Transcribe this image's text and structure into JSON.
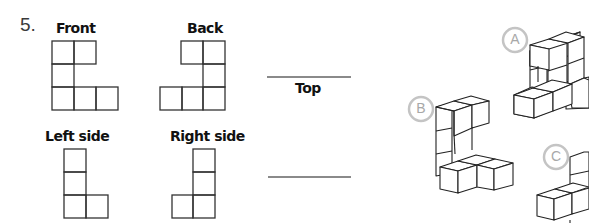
{
  "question": {
    "number": "5.",
    "views": {
      "front": {
        "label": "Front"
      },
      "back": {
        "label": "Back"
      },
      "left": {
        "label": "Left side"
      },
      "right": {
        "label": "Right side"
      }
    },
    "answer_blanks": [
      {
        "label": "Top"
      },
      {
        "label": ""
      }
    ],
    "options": [
      {
        "letter": "A"
      },
      {
        "letter": "B"
      },
      {
        "letter": "C"
      }
    ]
  }
}
